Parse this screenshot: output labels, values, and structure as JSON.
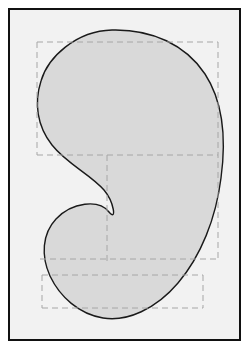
{
  "figure": {
    "title": "",
    "caption": "",
    "canvas": {
      "width": 251,
      "height": 351
    },
    "frame": {
      "x": 8,
      "y": 8,
      "width": 233,
      "height": 333,
      "border_color": "#111111",
      "border_width": 2,
      "background_color": "#f2f2f2"
    },
    "shape": {
      "name": "kidney-bean-closed-curve",
      "fill_color": "#d9d9d9",
      "stroke_color": "#1a1a1a",
      "stroke_width": 1.4,
      "extents": {
        "left_x": 36,
        "right_x": 222,
        "top_y": 30,
        "bottom_y": 320,
        "concave_notch_x": 112,
        "concave_notch_y": 212
      },
      "path": "M 112,30 C 152,29 186,45 205,74 C 224,103 226,141 221,178 C 216,218 201,256 178,283 C 156,309 127,322 103,318 C 79,314 60,297 50,276 C 41,256 42,234 56,219 C 72,202 99,199 109,212 C 117,222 114,202 104,190 C 90,174 67,164 52,145 C 37,126 34,103 41,81 C 48,57 76,31 112,30 Z"
    },
    "guides": {
      "name": "dashed-bounding-guides",
      "stroke_color": "#a6a6a6",
      "stroke_width": 1,
      "dash_pattern": "6,4",
      "rectangles": [
        {
          "name": "outer-bounding-box",
          "x": 37,
          "y": 42,
          "width": 181,
          "height": 113
        },
        {
          "name": "middle-bounding-box",
          "x": 107,
          "y": 155,
          "width": 111,
          "height": 104
        },
        {
          "name": "lower-left-bounding-box",
          "x": 40,
          "y": 155,
          "width": 67,
          "height": 104
        },
        {
          "name": "bottom-bounding-box",
          "x": 42,
          "y": 275,
          "width": 161,
          "height": 33
        }
      ],
      "segments": [
        {
          "name": "guide-hline-upper",
          "x1": 37,
          "y1": 42,
          "x2": 218,
          "y2": 42
        },
        {
          "name": "guide-vline-left-upper",
          "x1": 37,
          "y1": 42,
          "x2": 37,
          "y2": 155
        },
        {
          "name": "guide-vline-right",
          "x1": 218,
          "y1": 42,
          "x2": 218,
          "y2": 262
        },
        {
          "name": "guide-hline-middle",
          "x1": 37,
          "y1": 155,
          "x2": 218,
          "y2": 155
        },
        {
          "name": "guide-vline-center",
          "x1": 107,
          "y1": 155,
          "x2": 107,
          "y2": 262
        },
        {
          "name": "guide-hline-lower",
          "x1": 40,
          "y1": 259,
          "x2": 218,
          "y2": 259
        },
        {
          "name": "guide-vline-bottom-left",
          "x1": 42,
          "y1": 275,
          "x2": 42,
          "y2": 308
        },
        {
          "name": "guide-hline-bottom",
          "x1": 42,
          "y1": 308,
          "x2": 203,
          "y2": 308
        },
        {
          "name": "guide-vline-bottom-right",
          "x1": 203,
          "y1": 275,
          "x2": 203,
          "y2": 308
        },
        {
          "name": "guide-hline-bottom-top",
          "x1": 42,
          "y1": 275,
          "x2": 203,
          "y2": 275
        }
      ]
    },
    "colors": {
      "page_background": "#ffffff",
      "panel_background": "#f2f2f2",
      "shape_fill": "#d9d9d9",
      "shape_stroke": "#1a1a1a",
      "guide_stroke": "#a6a6a6",
      "frame_border": "#111111"
    }
  }
}
